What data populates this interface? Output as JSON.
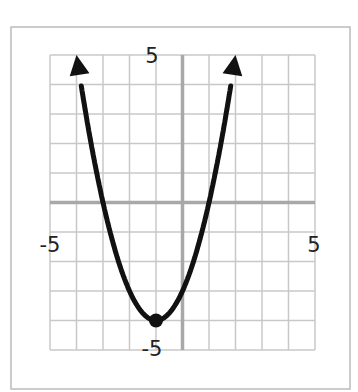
{
  "chart_data": {
    "type": "line",
    "title": "",
    "function": "y = (x + 1)^2 - 4",
    "xlabel": "",
    "ylabel": "",
    "xlim": [
      -5,
      5
    ],
    "ylim": [
      -5,
      5
    ],
    "grid": true,
    "tick_labels": {
      "x_min": "-5",
      "x_max": "5",
      "y_max": "5",
      "y_min": "-5"
    },
    "vertex": {
      "x": -1,
      "y": -4
    },
    "x": [
      -4,
      -3,
      -2,
      -1,
      0,
      1,
      2
    ],
    "y": [
      5,
      0,
      -3,
      -4,
      -3,
      0,
      5
    ],
    "arrows": "both ends",
    "colors": {
      "curve": "#111111",
      "grid": "#c8c8c8",
      "axis": "#a8a8a8",
      "border": "#b0b0b0"
    }
  }
}
